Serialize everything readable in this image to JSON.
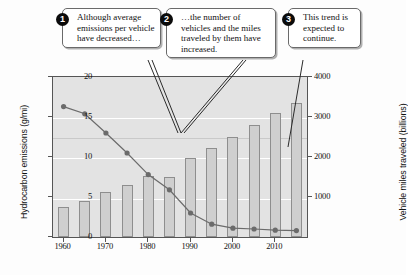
{
  "chart_data": {
    "type": "bar",
    "title": "",
    "subtitle": "",
    "xlabel": "",
    "ylabel": "Hydrocarbon emissions (g/mi)",
    "ylabel_right": "Vehicle miles traveled (billions)",
    "grid": true,
    "legend": "none",
    "x": [
      1960,
      1965,
      1970,
      1975,
      1980,
      1985,
      1990,
      1995,
      2000,
      2005,
      2010,
      2015
    ],
    "categories": [
      "1960",
      "1965",
      "1970",
      "1975",
      "1980",
      "1985",
      "1990",
      "1995",
      "2000",
      "2005",
      "2010",
      "2015"
    ],
    "xtick_labels": [
      "1960",
      "1970",
      "1980",
      "1990",
      "2000",
      "2010"
    ],
    "xtick_values": [
      1960,
      1970,
      1980,
      1990,
      2000,
      2010
    ],
    "xlim": [
      1957.5,
      2017.5
    ],
    "ylim": [
      0,
      20
    ],
    "ytick_labels": [
      "0",
      "5",
      "10",
      "15",
      "20"
    ],
    "ytick_values": [
      0,
      5,
      10,
      15,
      20
    ],
    "ylim_right": [
      0,
      4000
    ],
    "ytick_labels_right": [
      "1000",
      "2000",
      "3000",
      "4000"
    ],
    "ytick_values_right": [
      1000,
      2000,
      3000,
      4000
    ],
    "series": [
      {
        "name": "Vehicle miles traveled (billions)",
        "type": "bar",
        "axis": "right",
        "color": "#cfcfcf",
        "edge_color": "#8e8e8e",
        "values": [
          740,
          900,
          1120,
          1300,
          1530,
          1500,
          1980,
          2230,
          2500,
          2800,
          3100,
          3350
        ]
      },
      {
        "name": "Hydrocarbon emissions (g/mi)",
        "type": "line",
        "axis": "left",
        "color": "#6b6b6b",
        "marker": "circle",
        "values": [
          16.3,
          15.4,
          13.0,
          10.5,
          7.8,
          5.9,
          3.0,
          1.6,
          1.1,
          1.0,
          0.85,
          0.8
        ]
      }
    ],
    "annotations": [
      {
        "number": "1",
        "text": "Although average emissions per vehicle have decreased…",
        "points_to": "emissions-line-1980"
      },
      {
        "number": "2",
        "text": "…the number of vehicles and the miles traveled by them have increased.",
        "points_to": "emissions-line-1980"
      },
      {
        "number": "3",
        "text": "This trend is expected to continue.",
        "points_to": "vmt-bar-2010"
      }
    ]
  },
  "axes": {
    "left": {
      "label": "Hydrocarbon emissions (g/mi)",
      "ticks": [
        "0",
        "5",
        "10",
        "15",
        "20"
      ]
    },
    "right": {
      "label": "Vehicle miles traveled (billions)",
      "ticks": [
        "1000",
        "2000",
        "3000",
        "4000"
      ]
    },
    "bottom": {
      "ticks": [
        "1960",
        "1970",
        "1980",
        "1990",
        "2000",
        "2010"
      ]
    }
  },
  "callouts": [
    {
      "badge": "1",
      "text": "Although average emissions per vehicle have decreased…"
    },
    {
      "badge": "2",
      "text": "…the number of vehicles and the miles traveled by them have increased."
    },
    {
      "badge": "3",
      "text": "This trend is expected to continue."
    }
  ],
  "colors": {
    "plot_background": "#e3e3e3",
    "bar_fill": "#cfcfcf",
    "bar_edge": "#8e8e8e",
    "line": "#6b6b6b",
    "gridline": "#ffffff",
    "frame": "#555555",
    "callout_background": "#ffffff",
    "callout_border": "#6a6a6a",
    "badge_background": "#0b0b0b"
  }
}
